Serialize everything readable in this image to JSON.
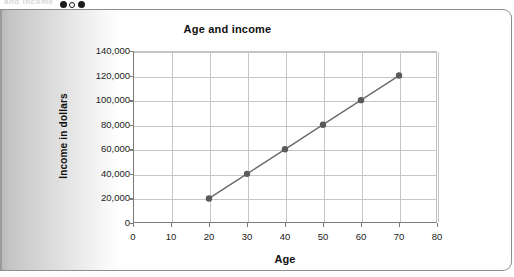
{
  "page": {
    "ghost_text_top": "and income",
    "marker_dots": [
      "filled",
      "hollow",
      "filled"
    ]
  },
  "chart_data": {
    "type": "line",
    "title": "Age and income",
    "xlabel": "Age",
    "ylabel": "Income in dollars",
    "x": [
      20,
      30,
      40,
      50,
      60,
      70
    ],
    "values": [
      20000,
      40000,
      60000,
      80000,
      100000,
      120000
    ],
    "series": [
      {
        "name": "Income",
        "x": [
          20,
          30,
          40,
          50,
          60,
          70
        ],
        "values": [
          20000,
          40000,
          60000,
          80000,
          100000,
          120000
        ]
      }
    ],
    "xlim": [
      0,
      80
    ],
    "ylim": [
      0,
      140000
    ],
    "xticks": [
      0,
      10,
      20,
      30,
      40,
      50,
      60,
      70,
      80
    ],
    "xtick_labels": [
      "0",
      "10",
      "20",
      "30",
      "40",
      "50",
      "60",
      "70",
      "80"
    ],
    "yticks": [
      0,
      20000,
      40000,
      60000,
      80000,
      100000,
      120000,
      140000
    ],
    "ytick_labels": [
      "0",
      "20,000",
      "40,000",
      "60,000",
      "80,000",
      "100,000",
      "120,000",
      "140,000"
    ],
    "grid": true,
    "legend": false,
    "marker": "circle",
    "line_color": "#6b6b6b",
    "marker_color": "#5a5a5a",
    "grid_color": "#c6c6c6",
    "axis_color": "#7b7b7b",
    "text_color": "#111111"
  }
}
